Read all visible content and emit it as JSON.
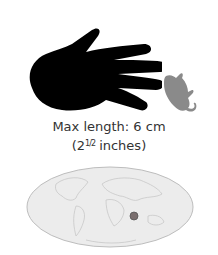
{
  "figure": {
    "size_label": "Max length: 6 cm",
    "inches_prefix": "(2",
    "inches_fraction": "1/2",
    "inches_suffix": "inches)",
    "hand_icon": "hand-silhouette",
    "animal_icon": "small-mammal-silhouette",
    "map": {
      "type": "world-map-ellipse",
      "marker": "range-dot"
    },
    "colors": {
      "hand": "#000000",
      "animal": "#8a8a8a",
      "map_fill": "#ececec",
      "map_border": "#bdbdbd",
      "marker": "#7a6e6e"
    }
  }
}
